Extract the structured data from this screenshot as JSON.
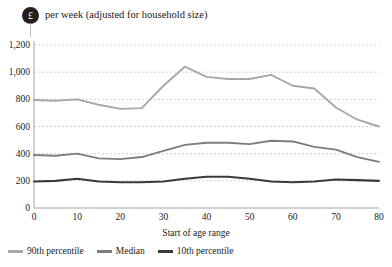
{
  "title": {
    "badge": "£",
    "badge_icon": "pound-sterling-badge-icon",
    "text": "per week (adjusted for household size)"
  },
  "chart_data": {
    "type": "line",
    "title": "£ per week (adjusted for household size)",
    "xlabel": "Start of age range",
    "ylabel": "",
    "xlim": [
      0,
      80
    ],
    "ylim": [
      0,
      1200
    ],
    "xticks": [
      "0",
      "10",
      "20",
      "30",
      "40",
      "50",
      "60",
      "70",
      "80"
    ],
    "yticks": [
      "0",
      "200",
      "400",
      "600",
      "800",
      "1,000",
      "1,200"
    ],
    "grid": "horizontal-dashed",
    "legend_position": "bottom-left",
    "x": [
      0,
      5,
      10,
      15,
      20,
      25,
      30,
      35,
      40,
      45,
      50,
      55,
      60,
      65,
      70,
      75,
      80
    ],
    "series": [
      {
        "name": "90th percentile",
        "color": "#a8a8a8",
        "values": [
          795,
          790,
          800,
          760,
          730,
          735,
          900,
          1040,
          965,
          950,
          950,
          980,
          900,
          880,
          740,
          650,
          600
        ]
      },
      {
        "name": "Median",
        "color": "#7d7d7d",
        "values": [
          390,
          385,
          400,
          365,
          360,
          375,
          420,
          465,
          480,
          480,
          470,
          495,
          490,
          450,
          430,
          375,
          340
        ]
      },
      {
        "name": "10th percentile",
        "color": "#3a3a3a",
        "values": [
          195,
          200,
          215,
          195,
          190,
          190,
          195,
          215,
          230,
          230,
          215,
          195,
          190,
          195,
          210,
          205,
          200
        ]
      }
    ]
  },
  "legend": {
    "items": [
      {
        "label": "90th percentile",
        "color": "#a8a8a8"
      },
      {
        "label": "Median",
        "color": "#7d7d7d"
      },
      {
        "label": "10th percentile",
        "color": "#3a3a3a"
      }
    ]
  },
  "axis": {
    "x_title": "Start of age range"
  }
}
